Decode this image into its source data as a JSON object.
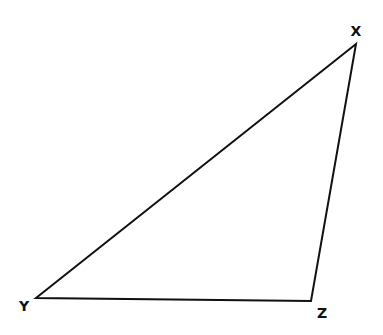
{
  "diagram": {
    "type": "triangle",
    "stroke_color": "#111111",
    "background": "#ffffff",
    "vertices": [
      {
        "name": "X",
        "label": "X",
        "x": 356,
        "y": 44,
        "label_x": 356,
        "label_y": 36
      },
      {
        "name": "Y",
        "label": "Y",
        "x": 36,
        "y": 298,
        "label_x": 24,
        "label_y": 311
      },
      {
        "name": "Z",
        "label": "Z",
        "x": 311,
        "y": 301,
        "label_x": 322,
        "label_y": 318
      }
    ],
    "edges": [
      {
        "from": "X",
        "to": "Y"
      },
      {
        "from": "Y",
        "to": "Z"
      },
      {
        "from": "Z",
        "to": "X"
      }
    ]
  }
}
